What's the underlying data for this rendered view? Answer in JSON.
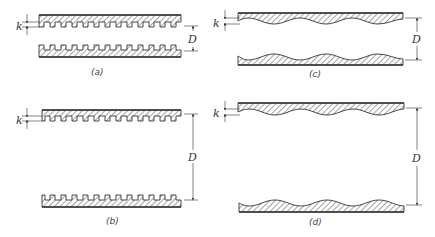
{
  "figure": {
    "colors": {
      "line": "#333333",
      "hatch": "#555555",
      "background": "#ffffff"
    },
    "panels": [
      {
        "id": "a",
        "caption": "(a)",
        "roughness": "square-rib",
        "k_label": "k",
        "d_label": "D"
      },
      {
        "id": "b",
        "caption": "(b)",
        "roughness": "square-rib",
        "k_label": "k",
        "d_label": "D"
      },
      {
        "id": "c",
        "caption": "(c)",
        "roughness": "wavy",
        "k_label": "k",
        "d_label": "D"
      },
      {
        "id": "d",
        "caption": "(d)",
        "roughness": "wavy",
        "k_label": "k",
        "d_label": "D"
      }
    ]
  }
}
